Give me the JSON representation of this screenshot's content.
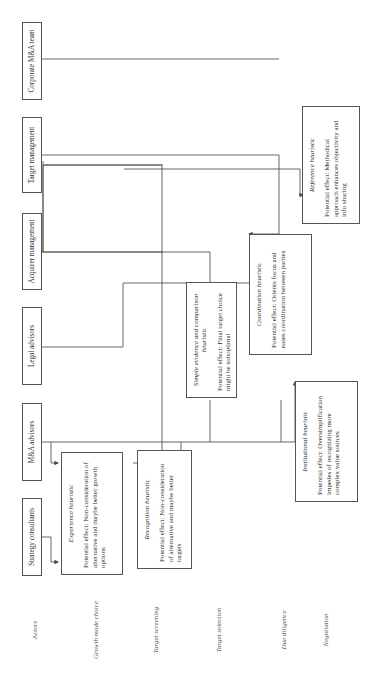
{
  "actors": [
    {
      "label": "Strategy consultants"
    },
    {
      "label": "M&A advisors"
    },
    {
      "label": "Legal advisors"
    },
    {
      "label": "Acquirer management"
    },
    {
      "label": "Target management"
    },
    {
      "label": "Corporate M&A team"
    }
  ],
  "phases": [
    {
      "label": "Actors"
    },
    {
      "label": "Growth mode choice"
    },
    {
      "label": "Target screening"
    },
    {
      "label": "Target selection"
    },
    {
      "label": "Due diligence"
    },
    {
      "label": "Negotiation"
    }
  ],
  "heuristics": {
    "experience": {
      "title": "Experience heuristic",
      "effect": "Potential effect: Non-consideration of alternative and maybe better growth options"
    },
    "recognition": {
      "title": "Recognition heuristic",
      "effect": "Potential effect: Non-consideration of alternative and maybe better targets"
    },
    "simple_evidence": {
      "title": "Simple evidence and comparison heuristic",
      "effect": "Potential effect: Final target choice might be suboptimal"
    },
    "coordination": {
      "title": "Coordination heuristic",
      "effect": "Potential effect: Orients focus and eases coordination between parties"
    },
    "institutional": {
      "title": "Institutional heuristic",
      "effect": "Potential effect: Oversimplification impedes of recognizing more complex value sources"
    },
    "reference": {
      "title": "Reference heuristic",
      "effect": "Potential effect: Methodical approach enhances objectivity and info sharing"
    }
  }
}
